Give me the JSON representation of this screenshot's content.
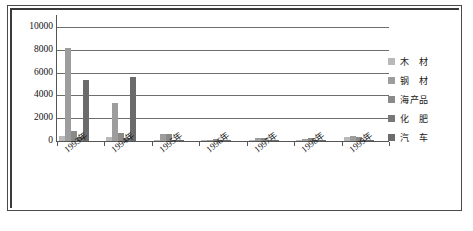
{
  "chart_data": {
    "type": "bar",
    "title": "",
    "subtitle": "",
    "xlabel": "",
    "ylabel": "",
    "ylim": [
      0,
      10000
    ],
    "ytick_labels": [
      "0",
      "2000",
      "4000",
      "6000",
      "8000",
      "10000"
    ],
    "ytick_values": [
      0,
      2000,
      4000,
      6000,
      8000,
      10000
    ],
    "grid": true,
    "legend_position": "right",
    "categories": [
      "1993年",
      "1994年",
      "1995年",
      "1996年",
      "1997年",
      "1998年",
      "1999年"
    ],
    "series": [
      {
        "name": "木　材",
        "color": "#b9b9b9",
        "values": [
          420,
          330,
          120,
          90,
          110,
          70,
          330
        ]
      },
      {
        "name": "钢　材",
        "color": "#9d9d9d",
        "values": [
          8200,
          3300,
          640,
          130,
          260,
          150,
          400
        ]
      },
      {
        "name": "海产品",
        "color": "#8a8a8a",
        "values": [
          860,
          660,
          600,
          150,
          230,
          230,
          390
        ]
      },
      {
        "name": "化　肥",
        "color": "#787878",
        "values": [
          360,
          230,
          110,
          80,
          90,
          60,
          130
        ]
      },
      {
        "name": "汽　车",
        "color": "#6b6b6b",
        "values": [
          5320,
          5600,
          90,
          70,
          60,
          50,
          110
        ]
      }
    ]
  },
  "colors": {
    "frame": "#4a4a4a",
    "grid": "#6e6e6e",
    "axis": "#555555",
    "text": "#111111",
    "background": "#ffffff"
  }
}
